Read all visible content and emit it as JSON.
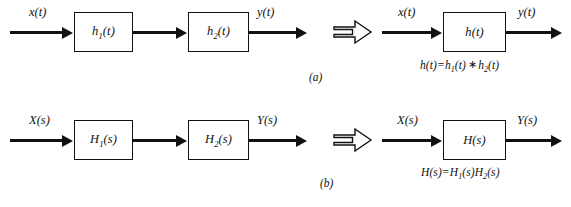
{
  "figure": {
    "background_color": "#ffffff",
    "stroke_color": "#111111",
    "panels": [
      {
        "id": "a",
        "caption": "(a)",
        "domain": "time",
        "left_side": {
          "input_label": "x(t)",
          "output_label": "y(t)",
          "blocks": [
            {
              "label_base": "h",
              "label_sub": "1",
              "label_arg": "(t)",
              "label_full": "h1(t)"
            },
            {
              "label_base": "h",
              "label_sub": "2",
              "label_arg": "(t)",
              "label_full": "h2(t)"
            }
          ]
        },
        "operator": "implies-double-arrow",
        "right_side": {
          "input_label": "x(t)",
          "output_label": "y(t)",
          "blocks": [
            {
              "label_base": "h",
              "label_sub": "",
              "label_arg": "(t)",
              "label_full": "h(t)"
            }
          ],
          "equation": {
            "lhs": "h(t)",
            "eq": "=",
            "term1_base": "h",
            "term1_sub": "1",
            "term1_arg": "(t)",
            "operator": "∗",
            "term2_base": "h",
            "term2_sub": "2",
            "term2_arg": "(t)",
            "full": "h(t)=h1(t) ∗ h2(t)"
          }
        }
      },
      {
        "id": "b",
        "caption": "(b)",
        "domain": "laplace",
        "left_side": {
          "input_label": "X(s)",
          "output_label": "Y(s)",
          "blocks": [
            {
              "label_base": "H",
              "label_sub": "1",
              "label_arg": "(s)",
              "label_full": "H1(s)"
            },
            {
              "label_base": "H",
              "label_sub": "2",
              "label_arg": "(s)",
              "label_full": "H2(s)"
            }
          ]
        },
        "operator": "implies-double-arrow",
        "right_side": {
          "input_label": "X(s)",
          "output_label": "Y(s)",
          "blocks": [
            {
              "label_base": "H",
              "label_sub": "",
              "label_arg": "(s)",
              "label_full": "H(s)"
            }
          ],
          "equation": {
            "lhs": "H(s)",
            "eq": "=",
            "term1_base": "H",
            "term1_sub": "1",
            "term1_arg": "(s)",
            "operator": "",
            "term2_base": "H",
            "term2_sub": "2",
            "term2_arg": "(s)",
            "full": "H(s)=H1(s)H2(s)"
          }
        }
      }
    ]
  }
}
